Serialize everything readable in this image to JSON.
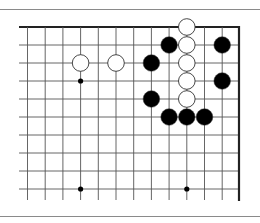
{
  "diagram": {
    "type": "go-board-fragment",
    "visible_columns": 13,
    "visible_rows": 10,
    "edges": [
      "top",
      "right"
    ],
    "stones": [
      {
        "color": "white",
        "col": 3,
        "row": 2
      },
      {
        "color": "white",
        "col": 5,
        "row": 2
      },
      {
        "color": "white",
        "col": 9,
        "row": 0
      },
      {
        "color": "white",
        "col": 9,
        "row": 1
      },
      {
        "color": "white",
        "col": 9,
        "row": 2
      },
      {
        "color": "white",
        "col": 9,
        "row": 3
      },
      {
        "color": "white",
        "col": 9,
        "row": 4
      },
      {
        "color": "black",
        "col": 8,
        "row": 1
      },
      {
        "color": "black",
        "col": 7,
        "row": 2
      },
      {
        "color": "black",
        "col": 7,
        "row": 4
      },
      {
        "color": "black",
        "col": 8,
        "row": 5
      },
      {
        "color": "black",
        "col": 9,
        "row": 5
      },
      {
        "color": "black",
        "col": 10,
        "row": 5
      },
      {
        "color": "black",
        "col": 11,
        "row": 1
      },
      {
        "color": "black",
        "col": 11,
        "row": 3
      }
    ],
    "star_points": [
      {
        "col": 3,
        "row": 3
      },
      {
        "col": 3,
        "row": 9
      },
      {
        "col": 9,
        "row": 9
      }
    ],
    "colors": {
      "grid": "#555555",
      "edge": "#222222",
      "black_stone": "#000000",
      "white_stone": "#ffffff",
      "stone_outline": "#333333"
    }
  }
}
